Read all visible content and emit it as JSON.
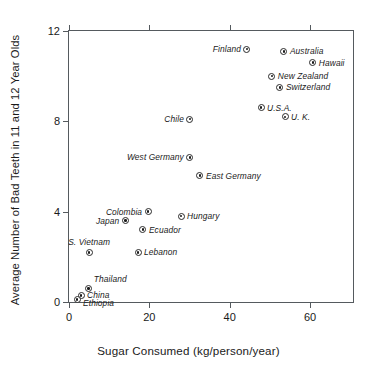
{
  "chart_data": {
    "type": "scatter",
    "title": "",
    "xlabel": "Sugar Consumed (kg/person/year)",
    "ylabel": "Average Number of Bad Teeth in 11 and 12 Year Olds",
    "xlim": [
      0,
      70.7
    ],
    "ylim": [
      0,
      12
    ],
    "xticks": [
      0,
      20,
      40,
      60
    ],
    "yticks": [
      0,
      4,
      8,
      12
    ],
    "xtick_labels": [
      "0",
      "20",
      "40",
      "60"
    ],
    "ytick_labels": [
      "0",
      "4",
      "8",
      "12"
    ],
    "grid": false,
    "legend": "none",
    "marker_style": "bullseye-circle",
    "points": [
      {
        "label": "Finland",
        "x": 44.3,
        "y": 11.2,
        "label_pos": "left"
      },
      {
        "label": "Australia",
        "x": 53.5,
        "y": 11.1,
        "label_pos": "right"
      },
      {
        "label": "Hawaii",
        "x": 60.7,
        "y": 10.6,
        "label_pos": "right"
      },
      {
        "label": "New Zealand",
        "x": 50.5,
        "y": 10.0,
        "label_pos": "right"
      },
      {
        "label": "Switzerland",
        "x": 52.5,
        "y": 9.5,
        "label_pos": "right"
      },
      {
        "label": "U.S.A.",
        "x": 47.8,
        "y": 8.6,
        "label_pos": "right"
      },
      {
        "label": "U. K.",
        "x": 53.8,
        "y": 8.2,
        "label_pos": "right"
      },
      {
        "label": "Chile",
        "x": 30.1,
        "y": 8.1,
        "label_pos": "left"
      },
      {
        "label": "West Germany",
        "x": 30.1,
        "y": 6.4,
        "label_pos": "left"
      },
      {
        "label": "East Germany",
        "x": 32.6,
        "y": 5.6,
        "label_pos": "right"
      },
      {
        "label": "Colombia",
        "x": 19.7,
        "y": 4.0,
        "label_pos": "left"
      },
      {
        "label": "Japan",
        "x": 14.0,
        "y": 3.6,
        "label_pos": "left"
      },
      {
        "label": "Hungary",
        "x": 27.9,
        "y": 3.8,
        "label_pos": "right"
      },
      {
        "label": "Ecuador",
        "x": 18.4,
        "y": 3.2,
        "label_pos": "right"
      },
      {
        "label": "S. Vietnam",
        "x": 5.0,
        "y": 2.2,
        "label_pos": "above"
      },
      {
        "label": "Lebanon",
        "x": 17.2,
        "y": 2.2,
        "label_pos": "right"
      },
      {
        "label": "Thailand",
        "x": 4.8,
        "y": 0.6,
        "label_pos": "above-right"
      },
      {
        "label": "China",
        "x": 3.0,
        "y": 0.3,
        "label_pos": "right"
      },
      {
        "label": "Ethiopia",
        "x": 2.0,
        "y": 0.1,
        "label_pos": "right-low"
      }
    ]
  },
  "colors": {
    "axis": "#555a5e",
    "text": "#1a1a1a",
    "marker_fill": "#ffffff",
    "marker_edge": "#2a2a2a",
    "background": "#ffffff"
  }
}
